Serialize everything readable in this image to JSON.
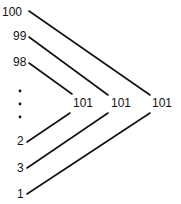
{
  "diagram": {
    "title": "",
    "type": "pairing-sum",
    "left_labels": [
      {
        "id": "l100",
        "text": "100",
        "x": 2,
        "y": 16
      },
      {
        "id": "l99",
        "text": "99",
        "x": 13,
        "y": 40
      },
      {
        "id": "l98",
        "text": "98",
        "x": 13,
        "y": 66
      },
      {
        "id": "l2",
        "text": "2",
        "x": 17,
        "y": 145
      },
      {
        "id": "l3",
        "text": "3",
        "x": 17,
        "y": 172
      },
      {
        "id": "l1",
        "text": "1",
        "x": 17,
        "y": 198
      }
    ],
    "ellipsis_dots": [
      {
        "x": 20,
        "y": 91
      },
      {
        "x": 20,
        "y": 104
      },
      {
        "x": 20,
        "y": 117
      }
    ],
    "sum_labels": [
      {
        "id": "s1",
        "text": "101",
        "x": 73,
        "y": 107
      },
      {
        "id": "s2",
        "text": "101",
        "x": 111,
        "y": 107
      },
      {
        "id": "s3",
        "text": "101",
        "x": 152,
        "y": 107
      }
    ],
    "lines": [
      {
        "from": "100",
        "to": "s3",
        "x1": 29,
        "y1": 11,
        "x2": 150,
        "y2": 95
      },
      {
        "from": "99",
        "to": "s2",
        "x1": 29,
        "y1": 37,
        "x2": 108,
        "y2": 95
      },
      {
        "from": "98",
        "to": "s1",
        "x1": 29,
        "y1": 63,
        "x2": 72,
        "y2": 94
      },
      {
        "from": "2",
        "to": "s1",
        "x1": 27,
        "y1": 142,
        "x2": 70,
        "y2": 113
      },
      {
        "from": "3",
        "to": "s2",
        "x1": 27,
        "y1": 168,
        "x2": 108,
        "y2": 113
      },
      {
        "from": "1",
        "to": "s3",
        "x1": 27,
        "y1": 194,
        "x2": 150,
        "y2": 113
      }
    ]
  }
}
